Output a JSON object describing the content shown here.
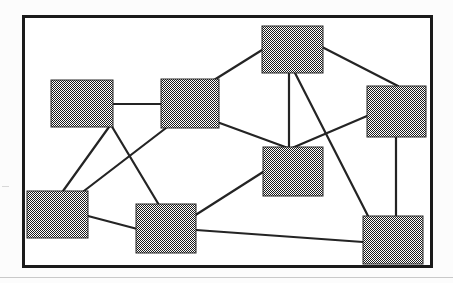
{
  "document": {
    "type": "figure",
    "title": "Undirected graph diagram with eight rectangular nodes",
    "frame": {
      "x": 22,
      "y": 15,
      "width": 411,
      "height": 253,
      "border_color": "#1a1a1a",
      "border_width": 3,
      "background_color": "#ffffff"
    },
    "canvas_background": "#fcfcfc",
    "bottom_rule_color": "#c9c9c9"
  },
  "graph_data": {
    "type": "node-link-diagram",
    "directed": false,
    "node_fill": "#777777",
    "node_fill_pattern": "dither-checkerboard",
    "node_stroke": "#2b2b2b",
    "edge_color": "#242424",
    "node_count": 8,
    "edge_count": 13,
    "nodes": [
      {
        "id": "n1",
        "label": "",
        "x": 51,
        "y": 80,
        "width": 62,
        "height": 47
      },
      {
        "id": "n2",
        "label": "",
        "x": 161,
        "y": 79,
        "width": 58,
        "height": 49
      },
      {
        "id": "n3",
        "label": "",
        "x": 262,
        "y": 26,
        "width": 61,
        "height": 47
      },
      {
        "id": "n4",
        "label": "",
        "x": 367,
        "y": 86,
        "width": 59,
        "height": 51
      },
      {
        "id": "n5",
        "label": "",
        "x": 27,
        "y": 191,
        "width": 61,
        "height": 47
      },
      {
        "id": "n6",
        "label": "",
        "x": 136,
        "y": 204,
        "width": 60,
        "height": 49
      },
      {
        "id": "n7",
        "label": "",
        "x": 263,
        "y": 147,
        "width": 60,
        "height": 49
      },
      {
        "id": "n8",
        "label": "",
        "x": 363,
        "y": 216,
        "width": 60,
        "height": 48
      }
    ],
    "edges": [
      {
        "source": "n1",
        "target": "n2",
        "x1": 113,
        "y1": 104,
        "x2": 161,
        "y2": 104
      },
      {
        "source": "n1",
        "target": "n5",
        "x1": 109,
        "y1": 127,
        "x2": 63,
        "y2": 191
      },
      {
        "source": "n1",
        "target": "n6",
        "x1": 111,
        "y1": 125,
        "x2": 159,
        "y2": 205
      },
      {
        "source": "n2",
        "target": "n3",
        "x1": 214,
        "y1": 80,
        "x2": 262,
        "y2": 50
      },
      {
        "source": "n2",
        "target": "n5",
        "x1": 166,
        "y1": 128,
        "x2": 80,
        "y2": 194
      },
      {
        "source": "n2",
        "target": "n7",
        "x1": 217,
        "y1": 122,
        "x2": 288,
        "y2": 148
      },
      {
        "source": "n3",
        "target": "n4",
        "x1": 322,
        "y1": 47,
        "x2": 398,
        "y2": 86
      },
      {
        "source": "n3",
        "target": "n7",
        "x1": 289,
        "y1": 73,
        "x2": 289,
        "y2": 147
      },
      {
        "source": "n3",
        "target": "n8",
        "x1": 295,
        "y1": 73,
        "x2": 368,
        "y2": 216
      },
      {
        "source": "n4",
        "target": "n7",
        "x1": 367,
        "y1": 116,
        "x2": 292,
        "y2": 148
      },
      {
        "source": "n4",
        "target": "n8",
        "x1": 396,
        "y1": 137,
        "x2": 396,
        "y2": 216
      },
      {
        "source": "n5",
        "target": "n6",
        "x1": 88,
        "y1": 216,
        "x2": 145,
        "y2": 231
      },
      {
        "source": "n6",
        "target": "n7",
        "x1": 172,
        "y1": 230,
        "x2": 263,
        "y2": 172
      },
      {
        "source": "n6",
        "target": "n8",
        "x1": 196,
        "y1": 230,
        "x2": 363,
        "y2": 242
      }
    ],
    "axis_labels": {},
    "legend": [],
    "annotations": []
  }
}
